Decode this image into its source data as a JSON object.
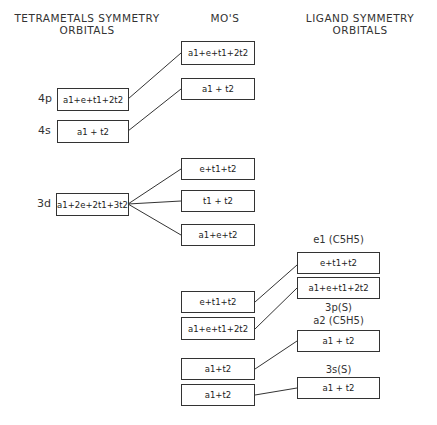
{
  "headers": {
    "left": "TETRAMETALS SYMMETRY ORBITALS",
    "left_line1": "TETRAMETALS SYMMETRY",
    "left_line2": "ORBITALS",
    "middle": "MO'S",
    "right_line1": "LIGAND SYMMETRY",
    "right_line2": "ORBITALS"
  },
  "metal_orbitals": [
    {
      "label": "4p",
      "symmetry": "a1+e+t1+2t2"
    },
    {
      "label": "4s",
      "symmetry": "a1 + t2"
    },
    {
      "label": "3d",
      "symmetry": "a1+2e+2t1+3t2"
    }
  ],
  "mos": [
    {
      "symmetry": "a1+e+t1+2t2"
    },
    {
      "symmetry": "a1 + t2"
    },
    {
      "symmetry": "e+t1+t2"
    },
    {
      "symmetry": "t1 + t2"
    },
    {
      "symmetry": "a1+e+t2"
    },
    {
      "symmetry": "e+t1+t2"
    },
    {
      "symmetry": "a1+e+t1+2t2"
    },
    {
      "symmetry": "a1+t2"
    },
    {
      "symmetry": "a1+t2"
    }
  ],
  "ligand_orbitals": [
    {
      "label": "e1 (C5H5)",
      "symmetry": "e+t1+t2"
    },
    {
      "label": "3p(S)",
      "symmetry": "a1+e+t1+2t2"
    },
    {
      "label": "a2 (C5H5)",
      "symmetry": "a1 + t2"
    },
    {
      "label": "3s(S)",
      "symmetry": "a1 + t2"
    }
  ],
  "colors": {
    "line": "#333333",
    "background": "#ffffff"
  }
}
